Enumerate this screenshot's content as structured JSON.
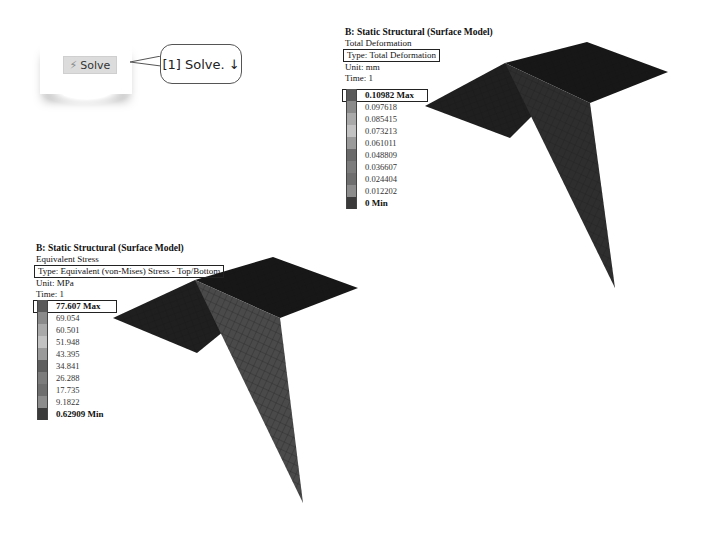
{
  "solve_snippet": {
    "button_label": "Solve",
    "icon": "lightning-solve-icon",
    "callout_text": "[1] Solve. ↓"
  },
  "total_deformation": {
    "title": "B: Static Structural (Surface Model)",
    "result_name": "Total Deformation",
    "type": "Type: Total Deformation",
    "unit": "Unit: mm",
    "time": "Time: 1",
    "legend": [
      {
        "label": "0.10982 Max",
        "color": "#5a5a5a",
        "bold": true
      },
      {
        "label": "0.097618",
        "color": "#8a8a8a"
      },
      {
        "label": "0.085415",
        "color": "#a9a9a9"
      },
      {
        "label": "0.073213",
        "color": "#c2c2c2"
      },
      {
        "label": "0.061011",
        "color": "#9a9a9a"
      },
      {
        "label": "0.048809",
        "color": "#6a6a6a"
      },
      {
        "label": "0.036607",
        "color": "#7c7c7c"
      },
      {
        "label": "0.024404",
        "color": "#6e6e6e"
      },
      {
        "label": "0.012202",
        "color": "#8c8c8c"
      },
      {
        "label": "0 Min",
        "color": "#3a3a3a",
        "bold": true
      }
    ]
  },
  "equivalent_stress": {
    "title": "B: Static Structural (Surface Model)",
    "result_name": "Equivalent Stress",
    "type": "Type: Equivalent (von-Mises) Stress - Top/Bottom",
    "unit": "Unit: MPa",
    "time": "Time: 1",
    "legend": [
      {
        "label": "77.607 Max",
        "color": "#5a5a5a",
        "bold": true
      },
      {
        "label": "69.054",
        "color": "#8a8a8a"
      },
      {
        "label": "60.501",
        "color": "#a9a9a9"
      },
      {
        "label": "51.948",
        "color": "#c2c2c2"
      },
      {
        "label": "43.395",
        "color": "#9a9a9a"
      },
      {
        "label": "34.841",
        "color": "#5e5e5e"
      },
      {
        "label": "26.288",
        "color": "#7c7c7c"
      },
      {
        "label": "17.735",
        "color": "#6e6e6e"
      },
      {
        "label": "9.1822",
        "color": "#8c8c8c"
      },
      {
        "label": "0.62909 Min",
        "color": "#3a3a3a",
        "bold": true
      }
    ]
  },
  "colors": {
    "plate_dark": "#1c1c1c",
    "fin_deformation": "#2e2e2e",
    "fin_stress": "#4a4a4a",
    "mesh_line": "#111111"
  }
}
